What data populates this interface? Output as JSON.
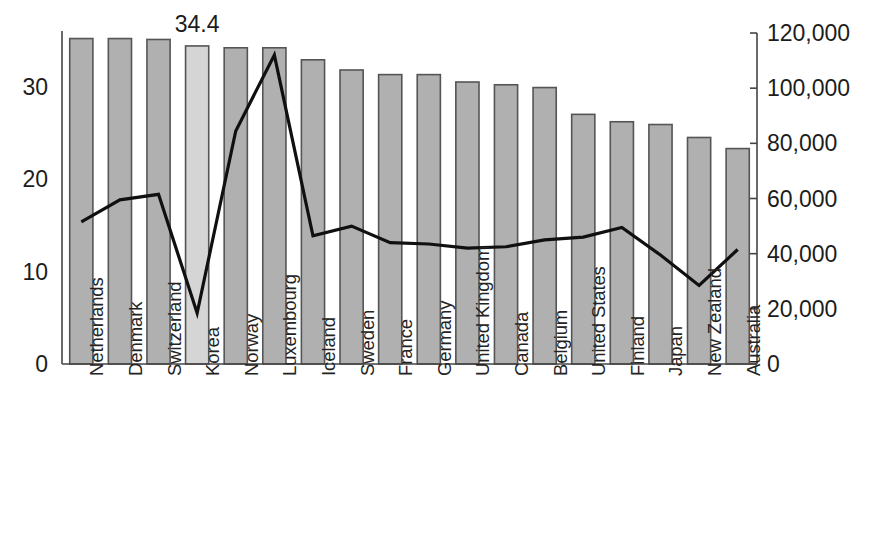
{
  "chart_data": {
    "type": "bar",
    "title": "",
    "subtitle": "",
    "xlabel": "",
    "ylabel": "",
    "y2label": "",
    "grid": false,
    "legend_position": "none",
    "categories": [
      "Netherlands",
      "Denmark",
      "Switzerland",
      "Korea",
      "Norway",
      "Luxembourg",
      "Iceland",
      "Sweden",
      "France",
      "Germany",
      "United Kingdom",
      "Canada",
      "Belgium",
      "United States",
      "Finland",
      "Japan",
      "New Zealand",
      "Australia"
    ],
    "series": [
      {
        "name": "bars",
        "axis": "left",
        "type": "bar",
        "values": [
          35.2,
          35.2,
          35.1,
          34.4,
          34.2,
          34.2,
          32.9,
          31.8,
          31.3,
          31.3,
          30.5,
          30.2,
          29.9,
          27.0,
          26.2,
          25.9,
          24.5,
          23.3
        ]
      },
      {
        "name": "line",
        "axis": "right",
        "type": "line",
        "values": [
          51500,
          59500,
          61500,
          18500,
          84500,
          112000,
          46500,
          50000,
          44000,
          43500,
          42000,
          42500,
          45000,
          46000,
          49500,
          39500,
          28500,
          41500
        ]
      }
    ],
    "highlighted_category": "Korea",
    "data_labels": [
      {
        "category": "Korea",
        "text": "34.4",
        "value": 34.4
      }
    ],
    "yaxis_left": {
      "ticks": [
        "0",
        "10",
        "20",
        "30"
      ],
      "tick_values": [
        0,
        10,
        20,
        30
      ],
      "ylim": [
        0,
        35.8
      ]
    },
    "yaxis_right": {
      "ticks": [
        "0",
        "20,000",
        "40,000",
        "60,000",
        "80,000",
        "100,000",
        "120,000"
      ],
      "tick_values": [
        0,
        20000,
        40000,
        60000,
        80000,
        100000,
        120000
      ],
      "ylim": [
        0,
        120000
      ]
    },
    "colors": {
      "bar_fill": "#b0b0b0",
      "bar_highlight_fill": "#d5d5d5",
      "bar_stroke": "#555555",
      "line_stroke": "#101010",
      "axis": "#444444",
      "text": "#1c1c1c",
      "background": "#ffffff"
    }
  }
}
